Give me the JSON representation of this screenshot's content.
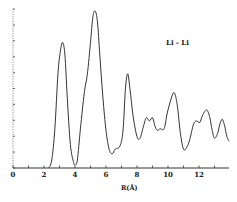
{
  "chart_data": {
    "type": "line",
    "title": "",
    "xlabel": "R(Å)",
    "ylabel": "",
    "xlim": [
      0,
      14
    ],
    "ylim": [
      0,
      1.0
    ],
    "xticks": [
      0,
      2,
      4,
      6,
      8,
      10,
      12
    ],
    "xtick_labels": [
      "0",
      "2",
      "4",
      "6",
      "8",
      "10",
      "12"
    ],
    "minor_xticks": [
      1,
      3,
      5,
      7,
      9,
      11,
      13
    ],
    "grid": false,
    "legend": null,
    "annotations": [
      {
        "text": "Li - Li",
        "position": "top-right"
      }
    ],
    "series": [
      {
        "name": "Li - Li",
        "x": [
          2.3,
          2.5,
          2.7,
          2.9,
          3.05,
          3.2,
          3.35,
          3.5,
          3.7,
          3.9,
          4.0,
          4.15,
          4.35,
          4.6,
          4.8,
          5.0,
          5.15,
          5.3,
          5.45,
          5.6,
          5.8,
          6.0,
          6.2,
          6.4,
          6.6,
          6.9,
          7.1,
          7.25,
          7.4,
          7.55,
          7.75,
          8.0,
          8.2,
          8.4,
          8.6,
          8.8,
          9.0,
          9.15,
          9.3,
          9.5,
          9.75,
          9.95,
          10.2,
          10.4,
          10.6,
          10.8,
          11.0,
          11.2,
          11.4,
          11.65,
          11.85,
          12.05,
          12.25,
          12.5,
          12.7,
          12.85,
          13.0,
          13.2,
          13.35,
          13.5,
          13.65,
          13.8,
          13.95
        ],
        "values": [
          0.0,
          0.05,
          0.25,
          0.6,
          0.74,
          0.8,
          0.72,
          0.45,
          0.15,
          0.04,
          0.02,
          0.05,
          0.25,
          0.48,
          0.6,
          0.8,
          0.96,
          1.0,
          0.93,
          0.72,
          0.45,
          0.24,
          0.12,
          0.09,
          0.12,
          0.14,
          0.24,
          0.5,
          0.6,
          0.5,
          0.33,
          0.2,
          0.19,
          0.26,
          0.32,
          0.3,
          0.32,
          0.27,
          0.24,
          0.25,
          0.25,
          0.35,
          0.44,
          0.48,
          0.4,
          0.22,
          0.12,
          0.13,
          0.18,
          0.28,
          0.3,
          0.29,
          0.34,
          0.37,
          0.32,
          0.24,
          0.19,
          0.22,
          0.28,
          0.31,
          0.27,
          0.2,
          0.17
        ]
      }
    ]
  }
}
